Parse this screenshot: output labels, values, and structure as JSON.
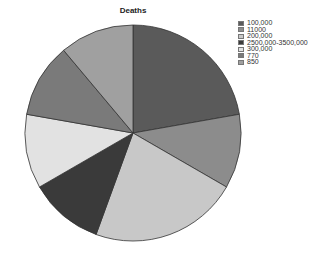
{
  "chart_data": {
    "type": "pie",
    "title": "Deaths",
    "categories": [
      "100,000",
      "11000",
      "200,000",
      "2500,000-3500,000",
      "300,000",
      "770",
      "850"
    ],
    "values": [
      2,
      1,
      2,
      1,
      1,
      1,
      1
    ],
    "percentages": [
      22.2,
      11.1,
      22.2,
      11.1,
      11.1,
      11.1,
      11.1
    ],
    "colors": [
      "#5a5a5a",
      "#8c8c8c",
      "#c8c8c8",
      "#3a3a3a",
      "#e2e2e2",
      "#7a7a7a",
      "#a0a0a0"
    ],
    "start_angle_deg": 0,
    "direction": "clockwise",
    "legend_position": "right",
    "grid": false
  },
  "legend": {
    "items": [
      {
        "label": "100,000",
        "color": "#5a5a5a"
      },
      {
        "label": "11000",
        "color": "#8c8c8c"
      },
      {
        "label": "200,000",
        "color": "#c8c8c8"
      },
      {
        "label": "2500,000-3500,000",
        "color": "#3a3a3a"
      },
      {
        "label": "300,000",
        "color": "#e2e2e2"
      },
      {
        "label": "770",
        "color": "#7a7a7a"
      },
      {
        "label": "850",
        "color": "#a0a0a0"
      }
    ]
  }
}
